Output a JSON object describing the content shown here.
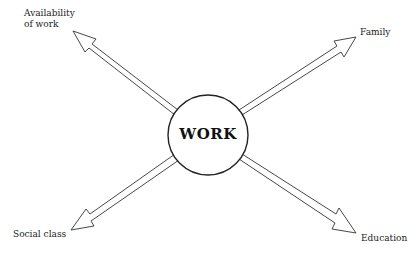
{
  "diagram": {
    "center": {
      "label": "WORK"
    },
    "nodes": [
      {
        "id": "availability",
        "label_lines": [
          "Availability",
          "of work"
        ],
        "position": "top-left"
      },
      {
        "id": "family",
        "label_lines": [
          "Family"
        ],
        "position": "top-right"
      },
      {
        "id": "social_class",
        "label_lines": [
          "Social class"
        ],
        "position": "bottom-left"
      },
      {
        "id": "education",
        "label_lines": [
          "Education"
        ],
        "position": "bottom-right"
      }
    ],
    "edges": [
      {
        "from": "WORK",
        "to": "availability",
        "style": "hollow-arrow"
      },
      {
        "from": "WORK",
        "to": "family",
        "style": "hollow-arrow"
      },
      {
        "from": "WORK",
        "to": "social_class",
        "style": "hollow-arrow"
      },
      {
        "from": "WORK",
        "to": "education",
        "style": "hollow-arrow"
      }
    ],
    "colors": {
      "stroke": "#333333",
      "background": "#ffffff",
      "text": "#222222"
    }
  }
}
